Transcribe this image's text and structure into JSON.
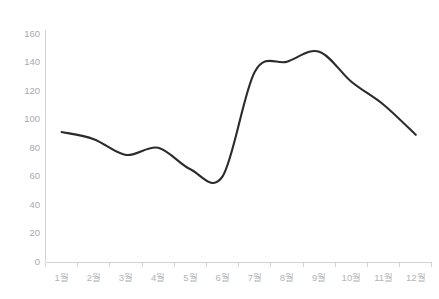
{
  "chart_data": {
    "type": "line",
    "title": "",
    "subtitle": "",
    "xlabel": "",
    "ylabel": "",
    "categories": [
      "1월",
      "2월",
      "3월",
      "4월",
      "5월",
      "6월",
      "7월",
      "8월",
      "9월",
      "10월",
      "11월",
      "12월"
    ],
    "values": [
      91,
      86,
      75,
      80,
      65,
      60,
      133,
      140,
      147,
      126,
      110,
      89
    ],
    "series": [
      {
        "name": "",
        "values": [
          91,
          86,
          75,
          80,
          65,
          60,
          133,
          140,
          147,
          126,
          110,
          89
        ]
      }
    ],
    "ylim": [
      0,
      160
    ],
    "yticks": [
      0,
      20,
      40,
      60,
      80,
      100,
      120,
      140,
      160
    ],
    "ytick_labels": [
      "0",
      "20",
      "40",
      "60",
      "80",
      "100",
      "120",
      "140",
      "160"
    ],
    "grid": false,
    "legend": "none",
    "smoothing": "spline",
    "line_color": "#2b2b2b",
    "axis_color": "#d2d2d6",
    "tick_label_color": "#a8a8ad"
  },
  "header": {
    "title_fragment_left": "",
    "title_fragment_right": ""
  }
}
